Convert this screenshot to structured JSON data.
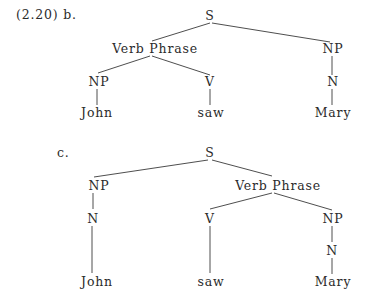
{
  "example": {
    "number": "(2.20) b.",
    "c_label": "c."
  },
  "tree_b": {
    "nodes": {
      "S": "S",
      "VP": "Verb Phrase",
      "NP_right": "NP",
      "NP_left": "NP",
      "V": "V",
      "N_right": "N",
      "John": "John",
      "saw": "saw",
      "Mary": "Mary"
    }
  },
  "tree_c": {
    "nodes": {
      "S": "S",
      "NP_left": "NP",
      "VP": "Verb Phrase",
      "N_left": "N",
      "V": "V",
      "NP_right": "NP",
      "N_right": "N",
      "John": "John",
      "saw": "saw",
      "Mary": "Mary"
    }
  }
}
